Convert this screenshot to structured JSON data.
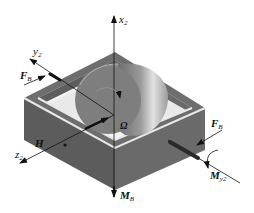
{
  "figure": {
    "colors": {
      "frame_top": "#6e6e6e",
      "frame_side": "#5a5a5a",
      "frame_rim": "#e6e6e6",
      "rotor_light": "#cfcfcf",
      "rotor_dark": "#7a7a7a",
      "axis": "#111111"
    },
    "labels": {
      "x_axis": {
        "main": "x",
        "sub": "2"
      },
      "y_axis": {
        "main": "y",
        "sub": "2"
      },
      "z_axis": {
        "main": "z",
        "sub": "2"
      },
      "force_left": {
        "main": "F",
        "sub": "B"
      },
      "force_right": {
        "main": "F",
        "sub": "B"
      },
      "angular_momentum": "H",
      "spin_rate": "Ω",
      "moment_bottom": {
        "main": "M",
        "sub": "B"
      },
      "moment_right": {
        "main": "M",
        "sub": "y2"
      }
    }
  }
}
